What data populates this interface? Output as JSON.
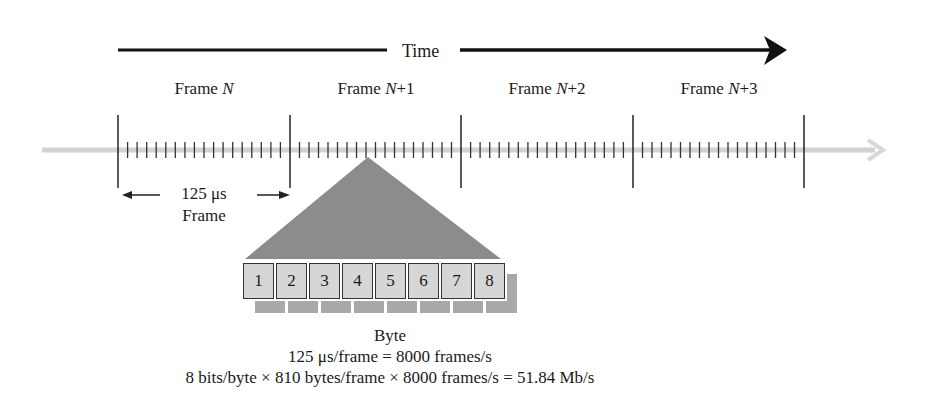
{
  "figure": {
    "time_axis": {
      "label": "Time"
    },
    "frames": [
      {
        "prefix": "Frame ",
        "var": "N",
        "suffix": ""
      },
      {
        "prefix": "Frame ",
        "var": "N",
        "suffix": "+1"
      },
      {
        "prefix": "Frame ",
        "var": "N",
        "suffix": "+2"
      },
      {
        "prefix": "Frame ",
        "var": "N",
        "suffix": "+3"
      }
    ],
    "frame_duration": {
      "value": "125 μs",
      "label": "Frame"
    },
    "bytes": [
      "1",
      "2",
      "3",
      "4",
      "5",
      "6",
      "7",
      "8"
    ],
    "byte_label": "Byte",
    "equations": [
      "125 μs/frame = 8000 frames/s",
      "8 bits/byte × 810 bytes/frame × 8000 frames/s = 51.84 Mb/s"
    ],
    "colors": {
      "triangle": "#8c8c8c",
      "byte_fill": "#d6d6d6",
      "byte_shadow": "#a9a9a9",
      "timeline": "#d0d0d0",
      "ink": "#1a1a1a"
    }
  }
}
